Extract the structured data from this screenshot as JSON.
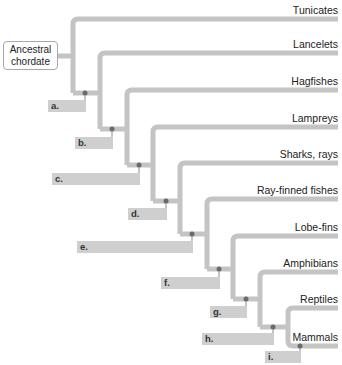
{
  "figure": {
    "top_partial_text": "",
    "root_label": "Ancestral chordate",
    "branch_color": "#c4c4c4",
    "node_dot_color": "#6a6a6a",
    "label_box_color": "#cfcfcf"
  },
  "taxa": [
    {
      "name": "Tunicates",
      "y": 19
    },
    {
      "name": "Lancelets",
      "y": 53
    },
    {
      "name": "Hagfishes",
      "y": 90
    },
    {
      "name": "Lampreys",
      "y": 127
    },
    {
      "name": "Sharks, rays",
      "y": 163
    },
    {
      "name": "Ray-finned fishes",
      "y": 199
    },
    {
      "name": "Lobe-fins",
      "y": 236
    },
    {
      "name": "Amphibians",
      "y": 272
    },
    {
      "name": "Reptiles",
      "y": 308
    },
    {
      "name": "Mammals",
      "y": 346
    }
  ],
  "nodes": [
    {
      "label": "a.",
      "value": ""
    },
    {
      "label": "b.",
      "value": ""
    },
    {
      "label": "c.",
      "value": ""
    },
    {
      "label": "d.",
      "value": ""
    },
    {
      "label": "e.",
      "value": ""
    },
    {
      "label": "f.",
      "value": ""
    },
    {
      "label": "g.",
      "value": ""
    },
    {
      "label": "h.",
      "value": ""
    },
    {
      "label": "i.",
      "value": ""
    }
  ]
}
